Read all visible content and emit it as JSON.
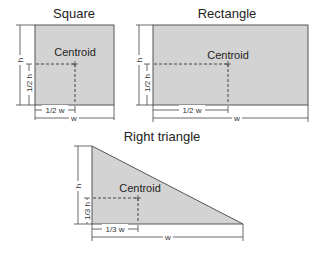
{
  "diagram": {
    "square": {
      "title": "Square",
      "centroid_label": "Centroid",
      "height_label": "h",
      "half_height_label": "1/2 h",
      "half_width_label": "1/2 w",
      "width_label": "w"
    },
    "rectangle": {
      "title": "Rectangle",
      "centroid_label": "Centroid",
      "height_label": "h",
      "half_height_label": "1/2 h",
      "half_width_label": "1/2 w",
      "width_label": "w"
    },
    "triangle": {
      "title": "Right triangle",
      "centroid_label": "Centroid",
      "height_label": "h",
      "third_height_label": "1/3 h",
      "third_width_label": "1/3 w",
      "width_label": "w"
    },
    "colors": {
      "fill": "#d3d3d3",
      "stroke": "#555555",
      "text": "#222222"
    }
  }
}
